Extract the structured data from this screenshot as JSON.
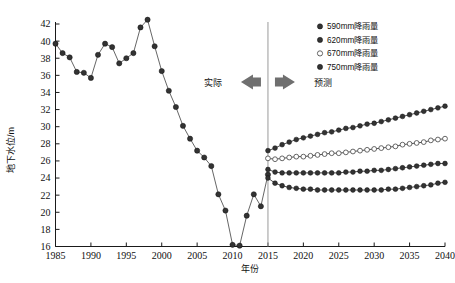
{
  "chart_data": {
    "type": "line",
    "title": "",
    "xlabel": "年份",
    "ylabel": "地下水位/m",
    "xlim": [
      1985,
      2040
    ],
    "ylim": [
      16,
      42
    ],
    "xticks": [
      1985,
      1990,
      1995,
      2000,
      2005,
      2010,
      2015,
      2020,
      2025,
      2030,
      2035,
      2040
    ],
    "yticks": [
      16,
      18,
      20,
      22,
      24,
      26,
      28,
      30,
      32,
      34,
      36,
      38,
      40,
      42
    ],
    "grid": false,
    "legend_position": "top-right",
    "annotations": [
      {
        "text": "实际",
        "arrow": "left",
        "x": 2012
      },
      {
        "text": "预测",
        "arrow": "right",
        "x": 2017
      }
    ],
    "divider_year": 2015,
    "series": [
      {
        "name": "实测地下水位",
        "marker": "filled-circle",
        "x": [
          1985,
          1986,
          1987,
          1988,
          1989,
          1990,
          1991,
          1992,
          1993,
          1994,
          1995,
          1996,
          1997,
          1998,
          1999,
          2000,
          2001,
          2002,
          2003,
          2004,
          2005,
          2006,
          2007,
          2008,
          2009,
          2010,
          2011,
          2012,
          2013,
          2014,
          2015
        ],
        "values": [
          39.7,
          38.6,
          38.1,
          36.4,
          36.3,
          35.7,
          38.4,
          39.7,
          39.3,
          37.4,
          38.0,
          38.6,
          41.6,
          42.5,
          39.4,
          36.5,
          34.2,
          32.3,
          30.1,
          28.6,
          27.2,
          26.4,
          25.4,
          22.1,
          20.2,
          16.2,
          16.1,
          19.6,
          22.1,
          20.7,
          24.4
        ]
      },
      {
        "name": "750mm降雨量",
        "marker": "filled-circle",
        "x": [
          2015,
          2016,
          2017,
          2018,
          2019,
          2020,
          2021,
          2022,
          2023,
          2024,
          2025,
          2026,
          2027,
          2028,
          2029,
          2030,
          2031,
          2032,
          2033,
          2034,
          2035,
          2036,
          2037,
          2038,
          2039,
          2040
        ],
        "values": [
          27.2,
          27.5,
          27.9,
          28.2,
          28.5,
          28.7,
          28.9,
          29.1,
          29.3,
          29.4,
          29.6,
          29.8,
          29.9,
          30.1,
          30.3,
          30.4,
          30.6,
          30.8,
          31.0,
          31.2,
          31.4,
          31.6,
          31.8,
          32.0,
          32.2,
          32.4
        ]
      },
      {
        "name": "670mm降雨量",
        "marker": "open-circle",
        "x": [
          2015,
          2016,
          2017,
          2018,
          2019,
          2020,
          2021,
          2022,
          2023,
          2024,
          2025,
          2026,
          2027,
          2028,
          2029,
          2030,
          2031,
          2032,
          2033,
          2034,
          2035,
          2036,
          2037,
          2038,
          2039,
          2040
        ],
        "values": [
          26.3,
          26.2,
          26.3,
          26.4,
          26.5,
          26.5,
          26.6,
          26.7,
          26.8,
          26.9,
          26.9,
          27.0,
          27.1,
          27.2,
          27.3,
          27.4,
          27.5,
          27.6,
          27.7,
          27.9,
          28.0,
          28.1,
          28.2,
          28.4,
          28.5,
          28.6
        ]
      },
      {
        "name": "620mm降雨量",
        "marker": "filled-circle",
        "x": [
          2015,
          2016,
          2017,
          2018,
          2019,
          2020,
          2021,
          2022,
          2023,
          2024,
          2025,
          2026,
          2027,
          2028,
          2029,
          2030,
          2031,
          2032,
          2033,
          2034,
          2035,
          2036,
          2037,
          2038,
          2039,
          2040
        ],
        "values": [
          25.0,
          24.7,
          24.6,
          24.6,
          24.6,
          24.6,
          24.6,
          24.6,
          24.6,
          24.6,
          24.6,
          24.7,
          24.7,
          24.8,
          24.8,
          24.9,
          24.9,
          25.0,
          25.1,
          25.2,
          25.3,
          25.4,
          25.5,
          25.6,
          25.7,
          25.7
        ]
      },
      {
        "name": "590mm降雨量",
        "marker": "filled-circle",
        "x": [
          2015,
          2016,
          2017,
          2018,
          2019,
          2020,
          2021,
          2022,
          2023,
          2024,
          2025,
          2026,
          2027,
          2028,
          2029,
          2030,
          2031,
          2032,
          2033,
          2034,
          2035,
          2036,
          2037,
          2038,
          2039,
          2040
        ],
        "values": [
          24.0,
          23.4,
          23.1,
          22.9,
          22.8,
          22.7,
          22.7,
          22.6,
          22.6,
          22.6,
          22.6,
          22.6,
          22.6,
          22.6,
          22.6,
          22.6,
          22.6,
          22.7,
          22.7,
          22.8,
          22.9,
          23.0,
          23.1,
          23.2,
          23.4,
          23.5
        ]
      }
    ],
    "legend": [
      {
        "label": "590mm降雨量",
        "marker": "filled-circle"
      },
      {
        "label": "620mm降雨量",
        "marker": "filled-circle"
      },
      {
        "label": "670mm降雨量",
        "marker": "open-circle"
      },
      {
        "label": "750mm降雨量",
        "marker": "filled-circle"
      }
    ]
  },
  "axes": {
    "x_title": "年份",
    "y_title": "地下水位/m",
    "x_tick_labels": [
      "1985",
      "1990",
      "1995",
      "2000",
      "2005",
      "2010",
      "2015",
      "2020",
      "2025",
      "2030",
      "2035",
      "2040"
    ],
    "y_tick_labels": [
      "16",
      "18",
      "20",
      "22",
      "24",
      "26",
      "28",
      "30",
      "32",
      "34",
      "36",
      "38",
      "40",
      "42"
    ]
  },
  "annotations": {
    "actual_label": "实际",
    "forecast_label": "预测"
  },
  "legend": {
    "items": [
      {
        "label": "590mm降雨量"
      },
      {
        "label": "620mm降雨量"
      },
      {
        "label": "670mm降雨量"
      },
      {
        "label": "750mm降雨量"
      }
    ]
  },
  "colors": {
    "marker": "#333333",
    "line": "#555555",
    "axis": "#1a1a1a",
    "divider": "#9a9a9a",
    "arrow": "#6f6f6f"
  }
}
